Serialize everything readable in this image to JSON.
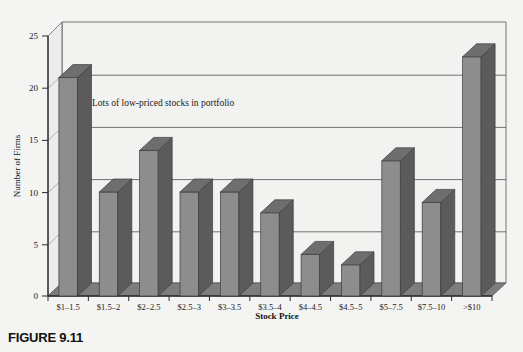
{
  "figure": {
    "caption": "FIGURE 9.11"
  },
  "chart_data": {
    "type": "bar",
    "title": "",
    "xlabel": "Stock Price",
    "ylabel": "Number of Firms",
    "categories": [
      "$1–1.5",
      "$1.5–2",
      "$2–2.5",
      "$2.5–3",
      "$3–3.5",
      "$3.5–4",
      "$4–4.5",
      "$4.5–5",
      "$5–7.5",
      "$7.5–10",
      ">$10"
    ],
    "values": [
      21,
      10,
      14,
      10,
      10,
      8,
      4,
      3,
      13,
      9,
      23
    ],
    "ylim": [
      0,
      25
    ],
    "yticks": [
      0,
      5,
      10,
      15,
      20,
      25
    ],
    "ytick_labels": [
      "0",
      "5",
      "10",
      "15",
      "20",
      "25"
    ],
    "grid": true,
    "grid_axis": "y",
    "legend": "none",
    "style": "3d-bar",
    "annotations": [
      {
        "text": "Lots of low-priced stocks in portfolio",
        "x_category": "$1.5–2",
        "y_value": 18
      }
    ],
    "colors": {
      "bar_face": "#8d8d8d",
      "bar_side": "#5b5b5b",
      "bar_top": "#6e6e6e",
      "floor": "#7d7d7d",
      "back_wall": "#f2f2f0",
      "grid_line": "#3a3a3a",
      "axis_line": "#2a2a2a",
      "page_background": "#f4f4f2"
    }
  }
}
